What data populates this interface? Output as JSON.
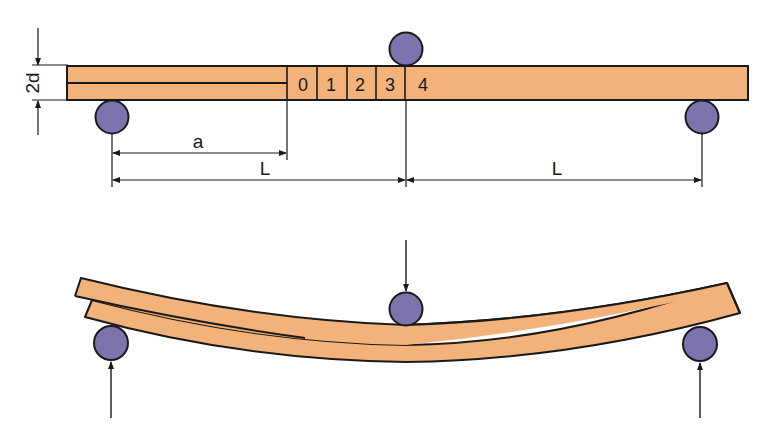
{
  "diagram": {
    "type": "three-point-bending-delamination-test",
    "colors": {
      "beam": "#f2b27a",
      "outline": "#1a1a1a",
      "roller": "#7b74ad",
      "background": "#ffffff"
    },
    "top_view": {
      "thickness_label": "2d",
      "crack_length_label": "a",
      "span_left_label": "L",
      "span_right_label": "L",
      "grid_cells": [
        "0",
        "1",
        "2",
        "3",
        "4"
      ]
    },
    "bottom_view": {
      "description": "Deformed beam under central load with delaminated left arm"
    }
  }
}
